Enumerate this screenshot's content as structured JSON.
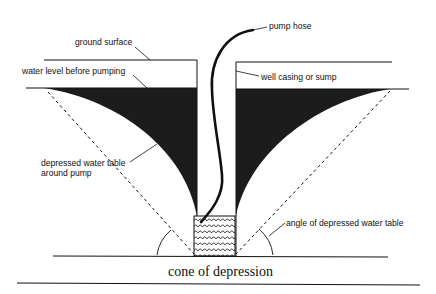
{
  "diagram": {
    "title": "cone of depression",
    "labels": {
      "pump_hose": "pump hose",
      "ground_surface": "ground surface",
      "water_level_before": "water level before pumping",
      "well_casing": "well casing or sump",
      "depressed_table_line1": "depressed water table",
      "depressed_table_line2": "around pump",
      "angle": "angle of depressed water table"
    },
    "colors": {
      "fill_dark": "#1c1c1c",
      "line": "#111111",
      "background": "#ffffff"
    }
  }
}
